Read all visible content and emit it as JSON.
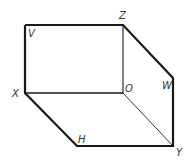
{
  "diagram": {
    "type": "projection-box",
    "stroke_color": "#1a1a1a",
    "label_color": "#333333",
    "points": {
      "V": [
        25,
        25
      ],
      "Z": [
        123,
        25
      ],
      "W": [
        173,
        78
      ],
      "X": [
        25,
        93
      ],
      "O": [
        123,
        93
      ],
      "H": [
        77,
        146
      ],
      "Y": [
        173,
        146
      ]
    },
    "labels": {
      "V": "V",
      "Z": "Z",
      "W": "W",
      "X": "X",
      "O": "O",
      "H": "H",
      "Y": "Y"
    },
    "thick_edges": [
      "V-Z",
      "Z-W",
      "W-Y",
      "Y-H",
      "H-X",
      "X-V"
    ],
    "thin_edges": [
      "X-O",
      "Z-O",
      "O-Y"
    ]
  }
}
